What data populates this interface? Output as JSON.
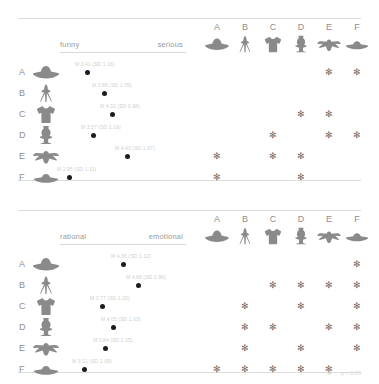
{
  "figure": {
    "row_letters": [
      "A",
      "B",
      "C",
      "D",
      "E",
      "F"
    ],
    "col_letters": [
      "A",
      "B",
      "C",
      "D",
      "E",
      "F"
    ],
    "icon_names": [
      "hat-silhouette",
      "easel-tripod-silhouette",
      "tshirt-silhouette",
      "dress-form-silhouette",
      "bird-silhouette",
      "flat-hat-silhouette"
    ],
    "footnote_star": "✻",
    "footnote_text": "p < 0.05"
  },
  "panels": [
    {
      "id": "panel-top",
      "scale_left": "funny",
      "scale_right": "serious",
      "rows": [
        {
          "letter": "A",
          "dot_x": 27,
          "label": "M 3.41 (SD 1.16)"
        },
        {
          "letter": "B",
          "dot_x": 44,
          "label": "M 3.86 (SD 1.05)"
        },
        {
          "letter": "C",
          "dot_x": 52,
          "label": "M 4.02 (SD 0.98)"
        },
        {
          "letter": "D",
          "dot_x": 33,
          "label": "M 3.57 (SD 1.19)"
        },
        {
          "letter": "E",
          "dot_x": 67,
          "label": "M 4.43 (SD 1.07)"
        },
        {
          "letter": "F",
          "dot_x": 9,
          "label": "M 2.95 (SD 1.11)"
        }
      ],
      "stars": [
        {
          "row": "A",
          "cols": [
            "E",
            "F"
          ]
        },
        {
          "row": "B",
          "cols": []
        },
        {
          "row": "C",
          "cols": [
            "D",
            "E"
          ]
        },
        {
          "row": "D",
          "cols": [
            "C",
            "E",
            "F"
          ]
        },
        {
          "row": "E",
          "cols": [
            "A",
            "C",
            "D"
          ]
        },
        {
          "row": "F",
          "cols": [
            "A",
            "D"
          ]
        }
      ]
    },
    {
      "id": "panel-bottom",
      "scale_left": "rational",
      "scale_right": "emotional",
      "rows": [
        {
          "letter": "A",
          "dot_x": 63,
          "label": "M 4.36 (SD 1.12)"
        },
        {
          "letter": "B",
          "dot_x": 78,
          "label": "M 4.68 (SD 0.96)"
        },
        {
          "letter": "C",
          "dot_x": 42,
          "label": "M 3.77 (SD 1.20)"
        },
        {
          "letter": "D",
          "dot_x": 53,
          "label": "M 4.05 (SD 1.03)"
        },
        {
          "letter": "E",
          "dot_x": 45,
          "label": "M 3.84 (SD 1.15)"
        },
        {
          "letter": "F",
          "dot_x": 24,
          "label": "M 3.31 (SD 1.09)"
        }
      ],
      "stars": [
        {
          "row": "A",
          "cols": [
            "F"
          ]
        },
        {
          "row": "B",
          "cols": [
            "C",
            "D",
            "E",
            "F"
          ]
        },
        {
          "row": "C",
          "cols": [
            "B",
            "D",
            "F"
          ]
        },
        {
          "row": "D",
          "cols": [
            "B",
            "C",
            "E",
            "F"
          ]
        },
        {
          "row": "E",
          "cols": [
            "B",
            "D",
            "F"
          ]
        },
        {
          "row": "F",
          "cols": [
            "A",
            "B",
            "C",
            "D",
            "E"
          ]
        }
      ]
    }
  ]
}
